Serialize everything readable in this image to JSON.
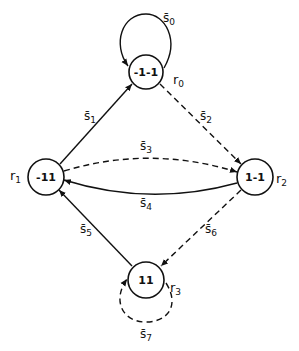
{
  "diagram": {
    "type": "state-transition-graph",
    "nodes": [
      {
        "id": "r0",
        "name": "r",
        "sub": "0",
        "value": "-1-1",
        "cx": 146,
        "cy": 72
      },
      {
        "id": "r1",
        "name": "r",
        "sub": "1",
        "value": "-11",
        "cx": 46,
        "cy": 177
      },
      {
        "id": "r2",
        "name": "r",
        "sub": "2",
        "value": "1-1",
        "cx": 255,
        "cy": 177
      },
      {
        "id": "r3",
        "name": "r",
        "sub": "3",
        "value": "11",
        "cx": 146,
        "cy": 280
      }
    ],
    "edges": [
      {
        "id": "s0",
        "label": "s̄",
        "sub": "0",
        "from": "r0",
        "to": "r0",
        "style": "solid"
      },
      {
        "id": "s1",
        "label": "s̄",
        "sub": "1",
        "from": "r1",
        "to": "r0",
        "style": "solid"
      },
      {
        "id": "s2",
        "label": "s̄",
        "sub": "2",
        "from": "r0",
        "to": "r2",
        "style": "dashed"
      },
      {
        "id": "s3",
        "label": "s̄",
        "sub": "3",
        "from": "r1",
        "to": "r2",
        "style": "dashed"
      },
      {
        "id": "s4",
        "label": "s̄",
        "sub": "4",
        "from": "r2",
        "to": "r1",
        "style": "solid"
      },
      {
        "id": "s5",
        "label": "s̄",
        "sub": "5",
        "from": "r3",
        "to": "r1",
        "style": "solid"
      },
      {
        "id": "s6",
        "label": "s̄",
        "sub": "6",
        "from": "r2",
        "to": "r3",
        "style": "dashed"
      },
      {
        "id": "s7",
        "label": "s̄",
        "sub": "7",
        "from": "r3",
        "to": "r3",
        "style": "dashed"
      }
    ]
  }
}
